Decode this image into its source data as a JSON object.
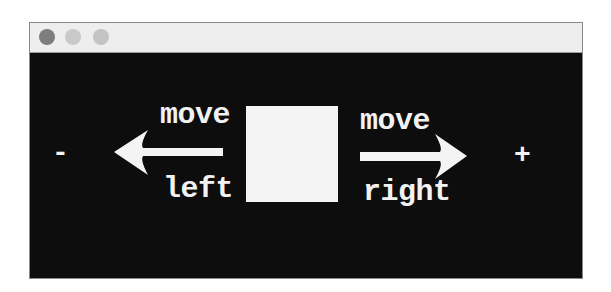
{
  "window": {
    "titlebar": {
      "buttons": [
        {
          "name": "close",
          "color": "#7e7e7e"
        },
        {
          "name": "minimize",
          "color": "#c9c9c9"
        },
        {
          "name": "zoom",
          "color": "#c4c4c4"
        }
      ]
    },
    "canvas": {
      "background": "#0d0d0d",
      "decrease_sign": "-",
      "increase_sign": "+",
      "left_control": {
        "line1": "move",
        "line2": "left",
        "arrow": "arrow-left-icon"
      },
      "right_control": {
        "line1": "move",
        "line2": "right",
        "arrow": "arrow-right-icon"
      },
      "square": {
        "color": "#f4f4f4"
      }
    }
  }
}
